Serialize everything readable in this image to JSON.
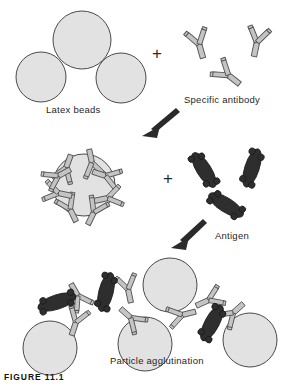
{
  "figure": {
    "caption": "FIGURE 11.1",
    "title": "Particle agglutination"
  },
  "labels": {
    "latex_beads": "Latex beads",
    "specific_antibody": "Specific antibody",
    "antigen": "Antigen",
    "particle_agglutination": "Particle agglutination"
  },
  "operators": {
    "plus_top": "+",
    "plus_middle": "+"
  },
  "colors": {
    "background": "#ffffff",
    "bead_fill": "#e2e2e2",
    "bead_stroke": "#4a4a4a",
    "antibody_fill": "#c4c4c4",
    "antibody_stroke": "#555555",
    "antigen_fill": "#2e2e2e",
    "antigen_stroke": "#1a1a1a",
    "arrow": "#2a2a2a",
    "text": "#1f1f1f"
  },
  "stages": [
    {
      "name": "reagents",
      "elements": [
        "latex-bead",
        "latex-bead",
        "latex-bead",
        "antibody",
        "antibody",
        "antibody"
      ]
    },
    {
      "name": "sensitized-particle",
      "elements": [
        "antibody-coated-bead",
        "antigen",
        "antigen",
        "antigen"
      ]
    },
    {
      "name": "agglutination-lattice",
      "elements": [
        "latex-bead",
        "latex-bead",
        "latex-bead",
        "latex-bead",
        "antigen",
        "antigen",
        "antigen",
        "antibody"
      ]
    }
  ],
  "arrows": [
    {
      "name": "arrow-stage-one-to-two",
      "direction": "down-left"
    },
    {
      "name": "arrow-stage-two-to-three",
      "direction": "down-left"
    }
  ]
}
